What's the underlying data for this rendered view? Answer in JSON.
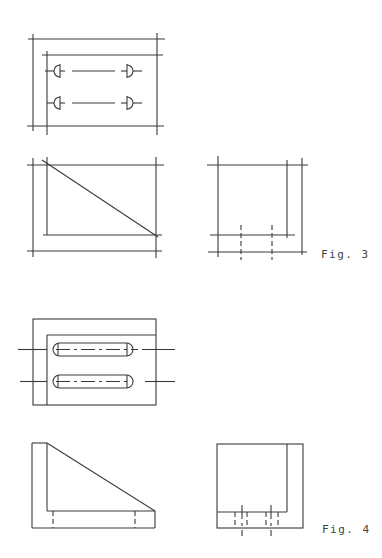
{
  "figures": [
    {
      "id": "fig3",
      "label": "Fig. 3",
      "views": [
        "top-view",
        "front-view",
        "side-view"
      ]
    },
    {
      "id": "fig4",
      "label": "Fig. 4",
      "views": [
        "top-view",
        "front-view",
        "side-view"
      ]
    }
  ],
  "colors": {
    "line": "#3a3a3a",
    "label": "#444444",
    "background": "#ffffff"
  }
}
